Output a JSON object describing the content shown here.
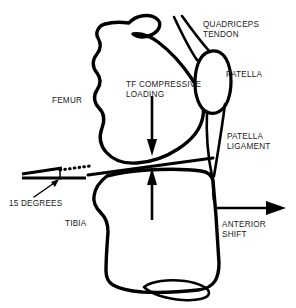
{
  "figure": {
    "kind": "anatomical-line-diagram",
    "background_color": "#ffffff",
    "line_color": "#000000",
    "text_color": "#1a1a1a"
  },
  "labels": {
    "quadriceps_tendon": "QUADRICEPS\nTENDON",
    "patella": "PATELLA",
    "patella_ligament": "PATELLA\nLIGAMENT",
    "tf_compressive_loading": "TF COMPRESSIVE\nLOADING",
    "femur": "FEMUR",
    "tibia": "TIBIA",
    "degrees": "15 DEGREES",
    "anterior_shift": "ANTERIOR\nSHIFT"
  },
  "structures": [
    {
      "name": "femur",
      "type": "bone"
    },
    {
      "name": "tibia",
      "type": "bone"
    },
    {
      "name": "patella",
      "type": "bone"
    },
    {
      "name": "quadriceps-tendon",
      "type": "soft-tissue"
    },
    {
      "name": "patella-ligament",
      "type": "soft-tissue"
    }
  ],
  "annotations": {
    "tibial_slope_degrees": "15 DEGREES",
    "compressive_force_direction": "vertical-converging",
    "anterior_shift_direction": "right"
  }
}
